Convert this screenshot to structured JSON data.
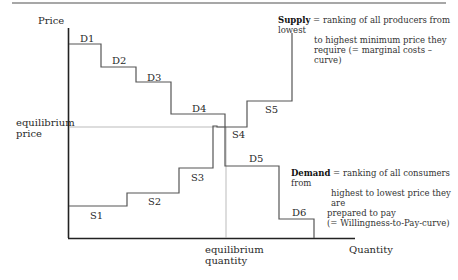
{
  "diagram": {
    "type": "step supply-demand diagram",
    "axes": {
      "y_label": "Price",
      "x_label": "Quantity"
    },
    "equilibrium": {
      "price_label_line1": "equilibrium",
      "price_label_line2": "price",
      "quantity_label_line1": "equilibrium",
      "quantity_label_line2": "quantity"
    },
    "demand_steps": [
      "D1",
      "D2",
      "D3",
      "D4",
      "D5",
      "D6"
    ],
    "supply_steps": [
      "S1",
      "S2",
      "S3",
      "S4",
      "S5"
    ],
    "supply_note": {
      "term": "Supply",
      "line1": " = ranking of all producers from lowest",
      "line2": "to highest minimum price they",
      "line3": "require (= marginal costs – curve)"
    },
    "demand_note": {
      "term": "Demand",
      "line1": " = ranking of all consumers from",
      "line2": "highest to lowest price they are",
      "line3": "prepared to pay",
      "line4": "(= Willingness-to-Pay-curve)"
    },
    "colors": {
      "axis": "#222222",
      "curve": "#555555",
      "guide": "#999999",
      "top_rule": "#888888"
    }
  }
}
